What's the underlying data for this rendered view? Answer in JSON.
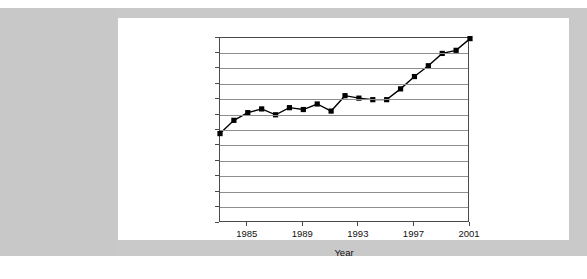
{
  "figure": {
    "background_color": "#c9c9c9",
    "card_color": "#ffffff",
    "frame_color": "#4a4a4a",
    "grid_color": "#8e8e8e",
    "series_color": "#000000"
  },
  "chart_data": {
    "type": "line",
    "title": "",
    "subtitle": "",
    "xlabel": "Year",
    "ylabel": "",
    "xlim": [
      1983,
      2001
    ],
    "ylim": [
      0.0,
      6.0
    ],
    "grid": true,
    "legend": false,
    "legend_position": "none",
    "marker": "square",
    "x_tick_labels": [
      "1985",
      "1989",
      "1993",
      "1997",
      "2001"
    ],
    "x_tick_values": [
      1985,
      1989,
      1993,
      1997,
      2001
    ],
    "y_tick_labels": [
      "0.0",
      "0.5",
      "1.0",
      "1.5",
      "2.0",
      "2.5",
      "3.0",
      "3.5",
      "4.0",
      "4.5",
      "5.0",
      "5.5",
      "6.0"
    ],
    "y_tick_values": [
      0.0,
      0.5,
      1.0,
      1.5,
      2.0,
      2.5,
      3.0,
      3.5,
      4.0,
      4.5,
      5.0,
      5.5,
      6.0
    ],
    "x": [
      1983,
      1984,
      1985,
      1986,
      1987,
      1988,
      1989,
      1990,
      1991,
      1992,
      1993,
      1994,
      1995,
      1996,
      1997,
      1998,
      1999,
      2000,
      2001
    ],
    "values": [
      2.9,
      3.33,
      3.58,
      3.7,
      3.51,
      3.74,
      3.68,
      3.86,
      3.63,
      4.13,
      4.05,
      4.0,
      4.0,
      4.35,
      4.75,
      5.1,
      5.5,
      5.6,
      5.98
    ],
    "series": [
      {
        "name": "",
        "values": [
          2.9,
          3.33,
          3.58,
          3.7,
          3.51,
          3.74,
          3.68,
          3.86,
          3.63,
          4.13,
          4.05,
          4.0,
          4.0,
          4.35,
          4.75,
          5.1,
          5.5,
          5.6,
          5.98
        ]
      }
    ]
  }
}
